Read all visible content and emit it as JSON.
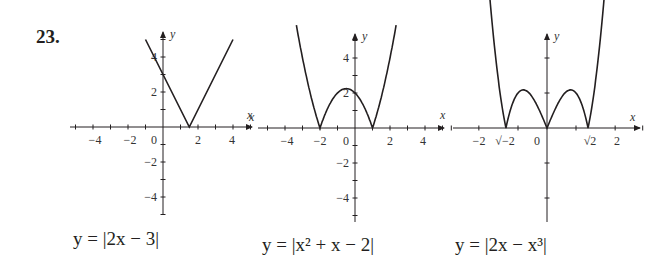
{
  "problem_number": "23.",
  "captions": [
    {
      "text": "y = |2x − 3|"
    },
    {
      "text": "y = |x² + x − 2|"
    },
    {
      "text": "y = |2x − x³|"
    }
  ],
  "chart_data": [
    {
      "type": "line",
      "title": "y = |2x − 3|",
      "xlabel": "x",
      "ylabel": "y",
      "xlim": [
        -5,
        5
      ],
      "ylim": [
        -5,
        5
      ],
      "x_ticks": [
        -4,
        -2,
        0,
        2,
        4
      ],
      "y_ticks": [
        -4,
        -2,
        2,
        4
      ],
      "x": [
        -1,
        1.5,
        4
      ],
      "y": [
        5,
        0,
        5
      ],
      "grid": false
    },
    {
      "type": "line",
      "title": "y = |x² + x − 2|",
      "xlabel": "x",
      "ylabel": "y",
      "xlim": [
        -5,
        5
      ],
      "ylim": [
        -5,
        5
      ],
      "x_ticks": [
        -4,
        -2,
        0,
        2,
        4
      ],
      "y_ticks": [
        -4,
        -2,
        2,
        4
      ],
      "x": [
        -3.3,
        -3,
        -2.5,
        -2,
        -1.5,
        -1,
        -0.5,
        0,
        0.5,
        1,
        1.5,
        2,
        2.3
      ],
      "y": [
        5.6,
        4,
        1.75,
        0,
        1.25,
        2,
        2.25,
        2,
        1.25,
        0,
        1.75,
        4,
        5.0
      ],
      "zeros": [
        -2,
        1
      ],
      "grid": false
    },
    {
      "type": "line",
      "title": "y = |2x − x³|",
      "xlabel": "x",
      "ylabel": "y",
      "xlim": [
        -2.5,
        2.5
      ],
      "ylim": [
        -2.5,
        2.5
      ],
      "x_tick_labels": [
        "−2",
        "−√2",
        "0",
        "√2",
        "2"
      ],
      "x_ticks": [
        -2,
        -1.414,
        0,
        1.414,
        2
      ],
      "x": [
        -2.0,
        -1.8,
        -1.6,
        -1.414,
        -1.2,
        -1.0,
        -0.816,
        -0.6,
        -0.4,
        -0.2,
        0,
        0.2,
        0.4,
        0.6,
        0.816,
        1.0,
        1.2,
        1.414,
        1.6,
        1.8,
        2.0
      ],
      "y": [
        4.0,
        2.232,
        0.896,
        0,
        0.672,
        1.0,
        1.089,
        0.984,
        0.736,
        0.392,
        0,
        0.392,
        0.736,
        0.984,
        1.089,
        1.0,
        0.672,
        0,
        0.896,
        2.232,
        4.0
      ],
      "zeros": [
        -1.414,
        0,
        1.414
      ],
      "grid": false
    }
  ]
}
